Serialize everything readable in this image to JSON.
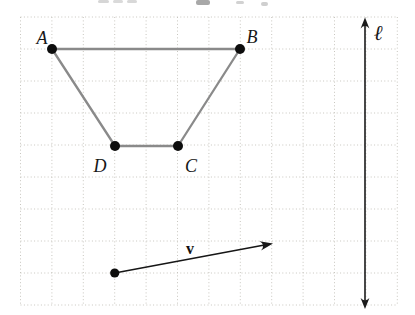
{
  "figure": {
    "background": "#ffffff",
    "grid": {
      "x0": 20.5,
      "y0": 17,
      "cols": 12,
      "rows": 9,
      "cell_w": 31.4,
      "cell_h": 32,
      "color": "#c8c6bf",
      "style": "dotted"
    },
    "trapezoid": {
      "stroke": "#8a8a8a",
      "stroke_width": 2.3,
      "point_color": "#0d0d0d",
      "point_radius": 5,
      "vertices": [
        {
          "id": "A",
          "label": "A",
          "x": 52,
          "y": 49,
          "lx": 42,
          "ly": 44
        },
        {
          "id": "B",
          "label": "B",
          "x": 240,
          "y": 49,
          "lx": 252,
          "ly": 43
        },
        {
          "id": "C",
          "label": "C",
          "x": 178,
          "y": 146,
          "lx": 191,
          "ly": 172
        },
        {
          "id": "D",
          "label": "D",
          "x": 115,
          "y": 146,
          "lx": 100,
          "ly": 172
        }
      ],
      "edges": [
        [
          "A",
          "B"
        ],
        [
          "B",
          "C"
        ],
        [
          "C",
          "D"
        ],
        [
          "D",
          "A"
        ]
      ]
    },
    "vector": {
      "label": "v",
      "x1": 114.7,
      "y1": 273,
      "x2": 273,
      "y2": 243.5,
      "color": "#161616",
      "stroke_width": 1.5,
      "dot_radius": 4.6,
      "lx": 190,
      "ly": 254
    },
    "line": {
      "label": "ℓ",
      "x": 365,
      "y1": 17.5,
      "y2": 309,
      "color": "#1b1b1b",
      "stroke_width": 1.6,
      "lx": 378,
      "ly": 40
    },
    "artifact_marks": [
      {
        "x": 98,
        "y": 0,
        "w": 11,
        "h": 3,
        "c": "#d6d6d6"
      },
      {
        "x": 113,
        "y": 0,
        "w": 10,
        "h": 3,
        "c": "#dadada"
      },
      {
        "x": 127,
        "y": 0,
        "w": 10,
        "h": 3,
        "c": "#d8d8d8"
      },
      {
        "x": 196,
        "y": 0,
        "w": 14,
        "h": 5,
        "c": "#a8a8a8"
      },
      {
        "x": 236,
        "y": 1,
        "w": 8,
        "h": 3,
        "c": "#d2d2d2"
      },
      {
        "x": 261,
        "y": 2,
        "w": 7,
        "h": 4,
        "c": "#cfcfcf"
      }
    ]
  }
}
